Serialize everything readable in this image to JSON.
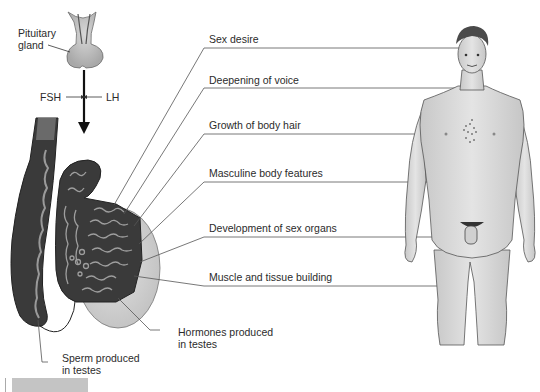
{
  "diagram": {
    "topic": "Male hormonal regulation: pituitary hormones act on testes, testosterone effects on body",
    "pituitary": {
      "label_line1": "Pituitary",
      "label_line2": "gland"
    },
    "hormones": {
      "fsh": "FSH",
      "lh": "LH"
    },
    "testes_labels": {
      "hormones_line1": "Hormones produced",
      "hormones_line2": "in testes",
      "sperm_line1": "Sperm produced",
      "sperm_line2": "in testes"
    },
    "effects": [
      {
        "label": "Sex desire",
        "target": "head"
      },
      {
        "label": "Deepening of voice",
        "target": "throat"
      },
      {
        "label": "Growth of body hair",
        "target": "chest"
      },
      {
        "label": "Masculine body features",
        "target": "abdomen"
      },
      {
        "label": "Development of sex organs",
        "target": "genitals"
      },
      {
        "label": "Muscle and tissue building",
        "target": "thigh"
      }
    ],
    "colors": {
      "tissue_dark": "#3a3a3a",
      "tubule_light": "#9a9a9a",
      "capsule": "#d6d6d6",
      "skin": "#d9d9d9",
      "line": "#555555"
    }
  }
}
